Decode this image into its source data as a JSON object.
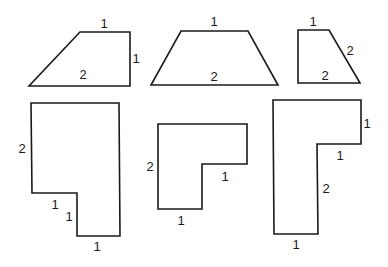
{
  "diagram": {
    "shapes": [
      {
        "id": "shape-1",
        "kind": "trapezoid",
        "points": "80,32 130,32 130,86 29,86",
        "labels": [
          {
            "text": "1",
            "x": 104,
            "y": 23
          },
          {
            "text": "1",
            "x": 136,
            "y": 58
          },
          {
            "text": "2",
            "x": 83,
            "y": 74
          }
        ]
      },
      {
        "id": "shape-2",
        "kind": "isosceles-trapezoid",
        "points": "181,31 248,31 278,85 151,85",
        "labels": [
          {
            "text": "1",
            "x": 214,
            "y": 21
          },
          {
            "text": "2",
            "x": 214,
            "y": 76
          }
        ]
      },
      {
        "id": "shape-3",
        "kind": "right-trapezoid",
        "points": "298,30 329,30 360,83 298,83",
        "labels": [
          {
            "text": "1",
            "x": 313,
            "y": 21
          },
          {
            "text": "2",
            "x": 350,
            "y": 50
          },
          {
            "text": "2",
            "x": 325,
            "y": 75
          }
        ]
      },
      {
        "id": "shape-4",
        "kind": "l-shape",
        "points": "31,103 119,103 120,236 77,236 77,193 32,193",
        "labels": [
          {
            "text": "2",
            "x": 22,
            "y": 148
          },
          {
            "text": "1",
            "x": 55,
            "y": 204
          },
          {
            "text": "1",
            "x": 69,
            "y": 216
          },
          {
            "text": "1",
            "x": 97,
            "y": 246
          }
        ]
      },
      {
        "id": "shape-5",
        "kind": "l-shape",
        "points": "158,124 247,124 247,164 202,164 202,209 158,209",
        "labels": [
          {
            "text": "2",
            "x": 150,
            "y": 166
          },
          {
            "text": "1",
            "x": 225,
            "y": 176
          },
          {
            "text": "1",
            "x": 181,
            "y": 220
          }
        ]
      },
      {
        "id": "shape-6",
        "kind": "l-shape",
        "points": "273,100 361,100 361,144 317,144 318,234 274,234",
        "labels": [
          {
            "text": "1",
            "x": 367,
            "y": 123
          },
          {
            "text": "1",
            "x": 340,
            "y": 155
          },
          {
            "text": "2",
            "x": 326,
            "y": 188
          },
          {
            "text": "1",
            "x": 296,
            "y": 244
          }
        ]
      }
    ]
  }
}
